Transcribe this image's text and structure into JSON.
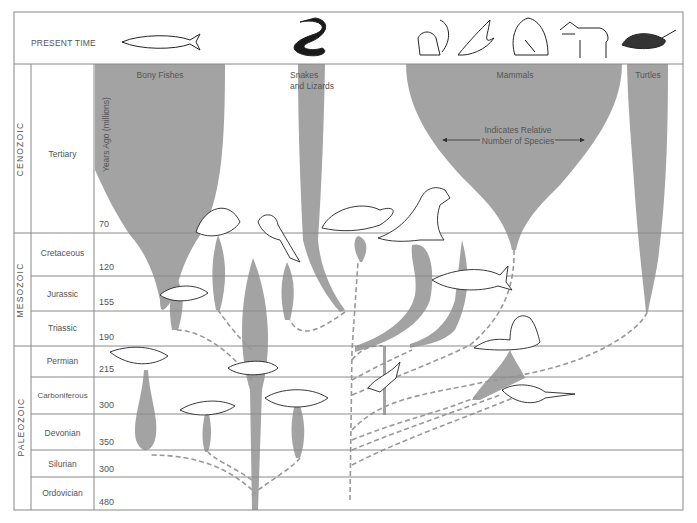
{
  "header": {
    "present_label": "PRESENT TIME"
  },
  "axis": {
    "label": "Years Ago (millions)"
  },
  "eras": [
    {
      "name": "CENOZOIC"
    },
    {
      "name": "MESOZOIC"
    },
    {
      "name": "PALEOZOIC"
    }
  ],
  "periods": [
    {
      "name": "Tertiary",
      "age": "70"
    },
    {
      "name": "Cretaceous",
      "age": "120"
    },
    {
      "name": "Jurassic",
      "age": "155"
    },
    {
      "name": "Triassic",
      "age": "190"
    },
    {
      "name": "Permian",
      "age": "215"
    },
    {
      "name": "Carboniferous",
      "age": "300"
    },
    {
      "name": "Devonian",
      "age": "350"
    },
    {
      "name": "Silurian",
      "age": "300"
    },
    {
      "name": "Ordovician",
      "age": "480"
    }
  ],
  "groups": [
    {
      "name": "Bony Fishes"
    },
    {
      "name": "Snakes and Lizards"
    },
    {
      "name": "Mammals"
    },
    {
      "name": "Turtles"
    }
  ],
  "legend": {
    "text": "Indicates Relative Number of Species"
  },
  "illustrations": {
    "present": [
      "herring-fish",
      "snake",
      "squirrel",
      "bat",
      "gorilla",
      "horse",
      "tortoise"
    ],
    "fossil": [
      "tropical-fish",
      "plesiosaur",
      "triceratops",
      "tyrannosaurus",
      "ichthyosaur",
      "ancient-fish",
      "dimetrodon",
      "lobe-finned-fish",
      "early-amphibian",
      "pelycosaur",
      "lizard-reptile",
      "primitive-shark",
      "crossopterygian"
    ]
  },
  "colors": {
    "spindle": "#a3a3a3",
    "lines": "#8a8a8a",
    "border": "#888888",
    "dashed": "#999999"
  }
}
